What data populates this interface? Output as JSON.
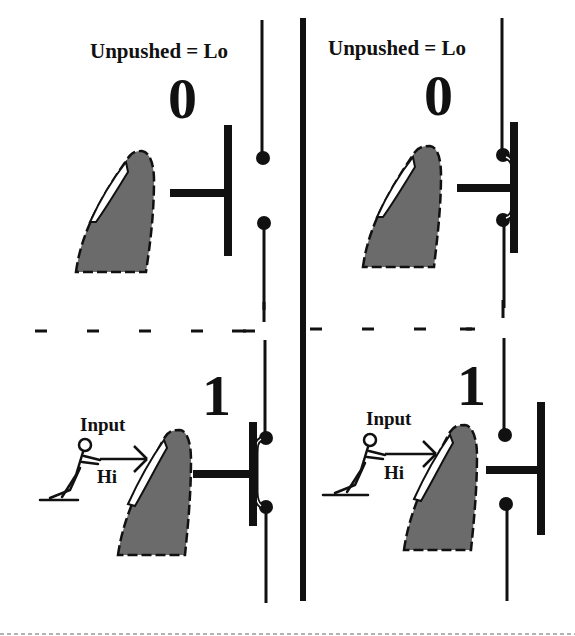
{
  "diagram": {
    "colors": {
      "ink": "#111111",
      "finger_fill": "#6b6b6b",
      "background": "#ffffff",
      "contact_line": "#ffffff"
    },
    "panels": [
      {
        "id": "top-left",
        "caption": "Unpushed = Lo",
        "state_digit": "0",
        "pushed": false,
        "switch_type": "normally-open",
        "contacts_closed": false
      },
      {
        "id": "top-right",
        "caption": "Unpushed = Lo",
        "state_digit": "0",
        "pushed": false,
        "switch_type": "normally-closed",
        "contacts_closed": true
      },
      {
        "id": "bottom-left",
        "state_digit": "1",
        "pushed": true,
        "input_label": "Input",
        "input_value": "Hi",
        "switch_type": "normally-open",
        "contacts_closed": true
      },
      {
        "id": "bottom-right",
        "state_digit": "1",
        "pushed": true,
        "input_label": "Input",
        "input_value": "Hi",
        "switch_type": "normally-closed",
        "contacts_closed": false
      }
    ],
    "icons": {
      "finger": "finger-icon",
      "person": "pushing-person-icon",
      "contact": "contact-dot-icon"
    }
  }
}
